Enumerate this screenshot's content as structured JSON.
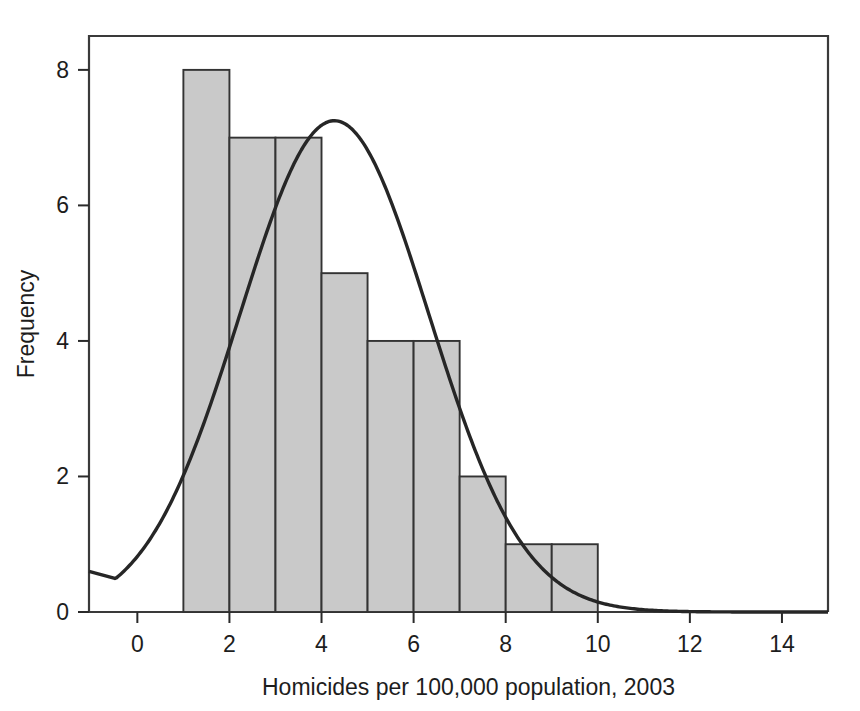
{
  "chart_data": {
    "type": "bar",
    "title": "",
    "subtitle": "",
    "xlabel": "Homicides per 100,000 population, 2003",
    "ylabel": "Frequency",
    "xlim": [
      -1.05,
      15.0
    ],
    "ylim": [
      0,
      8.5
    ],
    "grid": false,
    "legend": null,
    "bin_width": 1,
    "categories": [
      "1-2",
      "2-3",
      "3-4",
      "4-5",
      "5-6",
      "6-7",
      "7-8",
      "8-9",
      "9-10"
    ],
    "bin_edges": [
      1,
      2,
      3,
      4,
      5,
      6,
      7,
      8,
      9,
      10
    ],
    "values": [
      8,
      7,
      7,
      5,
      4,
      4,
      2,
      1,
      1
    ],
    "bar_fill": "#c9c9c9",
    "bar_stroke": "#333333",
    "xticks": [
      0,
      2,
      4,
      6,
      8,
      10,
      12,
      14
    ],
    "xtick_labels": [
      "0",
      "2",
      "4",
      "6",
      "8",
      "10",
      "12",
      "14"
    ],
    "yticks": [
      0,
      2,
      4,
      6,
      8
    ],
    "ytick_labels": [
      "0",
      "2",
      "4",
      "6",
      "8"
    ],
    "overlay": {
      "type": "line",
      "name": "normal-curve",
      "color": "#262626",
      "mean": 4.28,
      "sd": 2.05,
      "peak_x": 4.0,
      "peak_y": 7.25,
      "start_x": -1.05,
      "start_y": 0.6,
      "end_x": 15.0,
      "end_y": 0.0
    }
  },
  "axes": {
    "frame_color": "#3a3a3a",
    "tick_color": "#2a2a2a"
  }
}
